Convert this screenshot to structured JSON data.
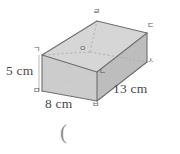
{
  "figure": {
    "type": "rectangular-cuboid-diagram",
    "dimensions": {
      "height_label": "5 cm",
      "width_label": "8 cm",
      "depth_label": "13 cm"
    },
    "vertices": {
      "top_front_left": "ㄱ",
      "top_back_left": "ㄹ",
      "top_back_right": "ㄷ",
      "center_hidden": "ㅇ",
      "top_front_right": "ㄴ",
      "bottom_back_right": "ㅅ",
      "bottom_front_left": "ㅁ",
      "bottom_front_right": "ㅂ"
    },
    "annotation": "(",
    "colors": {
      "face_fill": "#c9c9c9",
      "face_fill_light": "#d6d6d6",
      "face_fill_dark": "#bdbdbd",
      "edge_stroke": "#6e6e6e",
      "hidden_edge_stroke": "#a8a8a8",
      "text": "#4a4a4a",
      "background": "#ffffff"
    },
    "geometry": {
      "front_top_left": [
        42,
        55
      ],
      "front_top_right": [
        97,
        72
      ],
      "front_bottom_left": [
        42,
        91
      ],
      "front_bottom_right": [
        97,
        101
      ],
      "back_top_left": [
        97,
        21
      ],
      "back_top_right": [
        147,
        33
      ],
      "back_bottom_right": [
        147,
        62
      ],
      "back_bottom_left_hidden": [
        90,
        52
      ]
    }
  }
}
